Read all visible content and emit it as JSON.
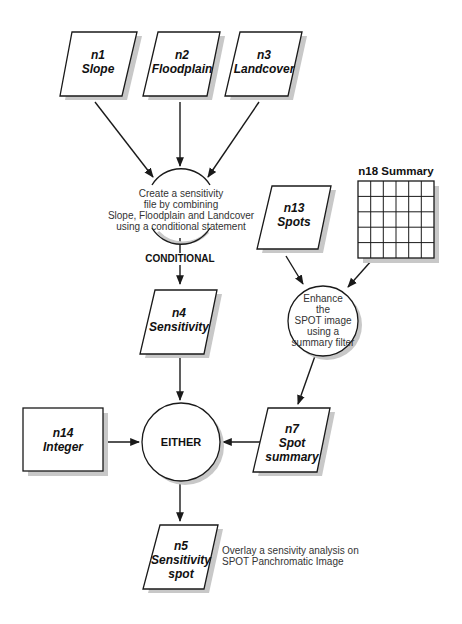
{
  "colors": {
    "stroke": "#1a1a1a",
    "shadow": "#c8c8c8",
    "background": "#ffffff"
  },
  "nodes": {
    "n1": {
      "id": "n1",
      "name": "Slope"
    },
    "n2": {
      "id": "n2",
      "name": "Floodplain"
    },
    "n3": {
      "id": "n3",
      "name": "Landcover"
    },
    "n4": {
      "id": "n4",
      "name": "Sensitivity"
    },
    "n5": {
      "id": "n5",
      "name1": "Sensitivity",
      "name2": "spot"
    },
    "n7": {
      "id": "n7",
      "name1": "Spot",
      "name2": "summary"
    },
    "n13": {
      "id": "n13",
      "name": "Spots"
    },
    "n14": {
      "id": "n14",
      "name": "Integer"
    },
    "n18": {
      "label": "n18 Summary",
      "grid_cols": 6,
      "grid_rows": 5
    }
  },
  "functions": {
    "conditional": {
      "lines": [
        "Create a sensitivity",
        "file by combining",
        "Slope, Floodplain and Landcover",
        "using a conditional statement"
      ],
      "operator": "CONDITIONAL"
    },
    "enhance": {
      "lines": [
        "Enhance",
        "the",
        "SPOT image",
        "using a",
        "summary filter"
      ]
    },
    "either": {
      "operator": "EITHER"
    }
  },
  "notes": {
    "overlay": [
      "Overlay a sensivity analysis on",
      "SPOT Panchromatic Image"
    ]
  }
}
